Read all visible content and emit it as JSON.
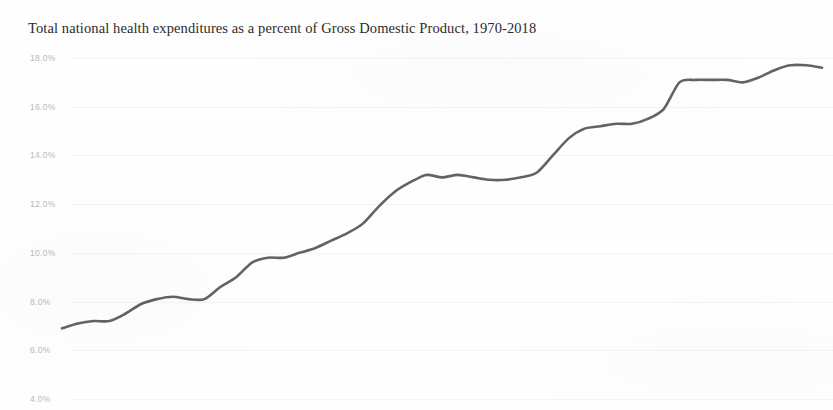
{
  "chart_data": {
    "type": "line",
    "title": "Total national health expenditures as a percent of Gross Domestic Product, 1970-2018",
    "xlabel": "",
    "ylabel": "",
    "ylim": [
      4.0,
      18.0
    ],
    "xlim": [
      1970,
      2018
    ],
    "grid": false,
    "legend": "none",
    "y_tick_labels": [
      "18.0%",
      "16.0%",
      "14.0%",
      "12.0%",
      "10.0%",
      "8.0%",
      "6.0%",
      "4.0%"
    ],
    "y_tick_values": [
      18.0,
      16.0,
      14.0,
      12.0,
      10.0,
      8.0,
      6.0,
      4.0
    ],
    "x_tick_labels": [],
    "series": [
      {
        "name": "Total national health expenditures as a percent of GDP",
        "color": "#4d4d4d",
        "x": [
          1970,
          1971,
          1972,
          1973,
          1974,
          1975,
          1976,
          1977,
          1978,
          1979,
          1980,
          1981,
          1982,
          1983,
          1984,
          1985,
          1986,
          1987,
          1988,
          1989,
          1990,
          1991,
          1992,
          1993,
          1994,
          1995,
          1996,
          1997,
          1998,
          1999,
          2000,
          2001,
          2002,
          2003,
          2004,
          2005,
          2006,
          2007,
          2008,
          2009,
          2010,
          2011,
          2012,
          2013,
          2014,
          2015,
          2016,
          2017,
          2018
        ],
        "values": [
          6.9,
          7.1,
          7.2,
          7.2,
          7.5,
          7.9,
          8.1,
          8.2,
          8.1,
          8.1,
          8.6,
          9.0,
          9.6,
          9.8,
          9.8,
          10.0,
          10.2,
          10.5,
          10.8,
          11.2,
          11.9,
          12.5,
          12.9,
          13.2,
          13.1,
          13.2,
          13.1,
          13.0,
          13.0,
          13.1,
          13.3,
          14.0,
          14.7,
          15.1,
          15.2,
          15.3,
          15.3,
          15.5,
          15.9,
          17.0,
          17.1,
          17.1,
          17.1,
          17.0,
          17.2,
          17.5,
          17.7,
          17.7,
          17.6
        ]
      }
    ]
  },
  "figure": {
    "background_color": "#fefefe",
    "title_color": "#2b2b2b",
    "tick_label_color": "#b9b9b9",
    "line_color": "#4d4d4d"
  }
}
